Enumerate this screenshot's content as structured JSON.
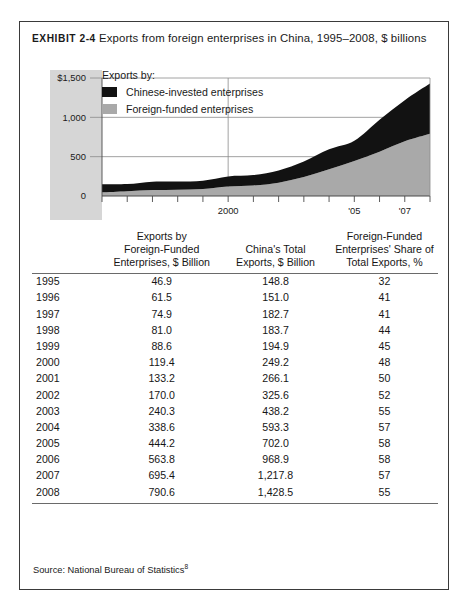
{
  "exhibit": {
    "label": "EXHIBIT 2-4",
    "title": "Exports from foreign enterprises in China, 1995–2008, $ billions"
  },
  "chart_legend": {
    "title": "Exports by:",
    "items": [
      {
        "label": "Chinese-invested enterprises",
        "color": "#121212"
      },
      {
        "label": "Foreign-funded enterprises",
        "color": "#a9a9a9"
      }
    ]
  },
  "table": {
    "headers": {
      "year": "",
      "ffe": "Exports by Foreign-Funded Enterprises, $ Billion",
      "ffe_l1": "Exports by",
      "ffe_l2": "Foreign-Funded",
      "ffe_l3": "Enterprises, $ Billion",
      "total": "China's Total Exports, $ Billion",
      "total_l1": "",
      "total_l2": "China's Total",
      "total_l3": "Exports, $ Billion",
      "share": "Foreign-Funded Enterprises' Share of Total Exports, %",
      "share_l1": "Foreign-Funded",
      "share_l2": "Enterprises' Share of",
      "share_l3": "Total Exports, %"
    },
    "rows": [
      {
        "year": "1995",
        "ffe": "46.9",
        "total": "148.8",
        "share": "32"
      },
      {
        "year": "1996",
        "ffe": "61.5",
        "total": "151.0",
        "share": "41"
      },
      {
        "year": "1997",
        "ffe": "74.9",
        "total": "182.7",
        "share": "41"
      },
      {
        "year": "1998",
        "ffe": "81.0",
        "total": "183.7",
        "share": "44"
      },
      {
        "year": "1999",
        "ffe": "88.6",
        "total": "194.9",
        "share": "45"
      },
      {
        "year": "2000",
        "ffe": "119.4",
        "total": "249.2",
        "share": "48"
      },
      {
        "year": "2001",
        "ffe": "133.2",
        "total": "266.1",
        "share": "50"
      },
      {
        "year": "2002",
        "ffe": "170.0",
        "total": "325.6",
        "share": "52"
      },
      {
        "year": "2003",
        "ffe": "240.3",
        "total": "438.2",
        "share": "55"
      },
      {
        "year": "2004",
        "ffe": "338.6",
        "total": "593.3",
        "share": "57"
      },
      {
        "year": "2005",
        "ffe": "444.2",
        "total": "702.0",
        "share": "58"
      },
      {
        "year": "2006",
        "ffe": "563.8",
        "total": "968.9",
        "share": "58"
      },
      {
        "year": "2007",
        "ffe": "695.4",
        "total": "1,217.8",
        "share": "57"
      },
      {
        "year": "2008",
        "ffe": "790.6",
        "total": "1,428.5",
        "share": "55"
      }
    ]
  },
  "source": {
    "text": "Source: National Bureau of Statistics",
    "note": "8"
  },
  "chart_data": {
    "type": "area",
    "title": "Exports from foreign enterprises in China, 1995–2008, $ billions",
    "xlabel": "",
    "ylabel": "$ billions",
    "stacked": true,
    "grid": true,
    "legend_position": "inside-top-left",
    "x": [
      1995,
      1996,
      1997,
      1998,
      1999,
      2000,
      2001,
      2002,
      2003,
      2004,
      2005,
      2006,
      2007,
      2008
    ],
    "xtick_labels": [
      "",
      "",
      "",
      "",
      "",
      "2000",
      "",
      "",
      "",
      "",
      "'05",
      "",
      "'07",
      ""
    ],
    "ytick_labels": [
      "0",
      "500",
      "1,000",
      "$1,500"
    ],
    "yticks": [
      0,
      500,
      1000,
      1500
    ],
    "ylim": [
      0,
      1500
    ],
    "xlim": [
      1995,
      2008
    ],
    "series": [
      {
        "name": "Foreign-funded enterprises",
        "color": "#a9a9a9",
        "values": [
          46.9,
          61.5,
          74.9,
          81.0,
          88.6,
          119.4,
          133.2,
          170.0,
          240.3,
          338.6,
          444.2,
          563.8,
          695.4,
          790.6
        ]
      },
      {
        "name": "Chinese-invested enterprises",
        "color": "#121212",
        "values": [
          101.9,
          89.5,
          107.8,
          102.7,
          106.3,
          129.8,
          132.9,
          155.6,
          197.9,
          254.7,
          257.8,
          405.1,
          522.4,
          637.9
        ]
      }
    ],
    "totals": [
      148.8,
      151.0,
      182.7,
      183.7,
      194.9,
      249.2,
      266.1,
      325.6,
      438.2,
      593.3,
      702.0,
      968.9,
      1217.8,
      1428.5
    ]
  }
}
